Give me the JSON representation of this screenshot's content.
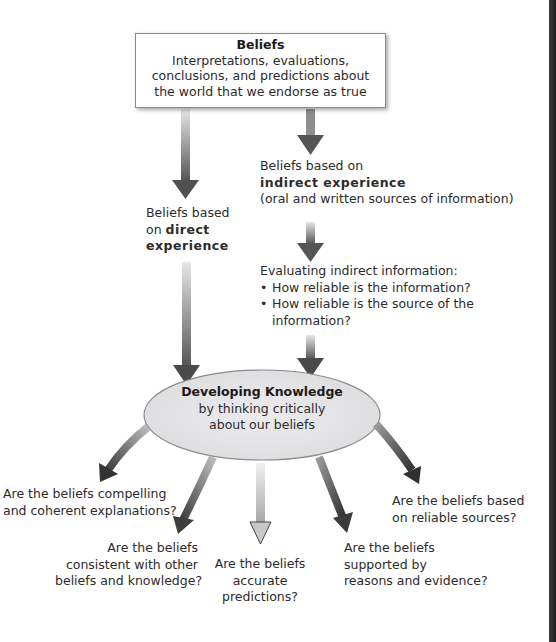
{
  "diagram": {
    "top_box": {
      "title": "Beliefs",
      "lines": [
        "Interpretations, evaluations,",
        "conclusions, and predictions about",
        "the world that we endorse as true"
      ]
    },
    "direct_branch": {
      "line1": "Beliefs based",
      "line2_prefix": "on ",
      "line2_bold": "direct",
      "line3_bold": "experience"
    },
    "indirect_branch": {
      "line1": "Beliefs based on",
      "line2_bold": "indirect experience",
      "line3": "(oral and written sources of information)"
    },
    "evaluation": {
      "heading": "Evaluating indirect information:",
      "bullets": [
        "How reliable is the information?",
        "How reliable is the source of the"
      ],
      "continuation": "information?"
    },
    "center_node": {
      "title": "Developing Knowledge",
      "line1": "by thinking critically",
      "line2": "about our beliefs"
    },
    "questions": [
      {
        "lines": [
          "Are the beliefs compelling",
          "and coherent explanations?"
        ]
      },
      {
        "lines": [
          "Are the beliefs",
          "consistent with other",
          "beliefs and knowledge?"
        ]
      },
      {
        "lines": [
          "Are the beliefs",
          "accurate",
          "predictions?"
        ]
      },
      {
        "lines": [
          "Are the beliefs",
          "supported by",
          "reasons and evidence?"
        ]
      },
      {
        "lines": [
          "Are the beliefs based",
          "on reliable sources?"
        ]
      }
    ]
  },
  "colors": {
    "ellipse_fill": "#e4e4e6",
    "ellipse_stroke": "#8a8a8a",
    "arrow_dark": "#4a4a4a",
    "arrow_light": "#d8d8d8",
    "text": "#2b2b2b",
    "edge_bar": "#2a2a2a"
  }
}
